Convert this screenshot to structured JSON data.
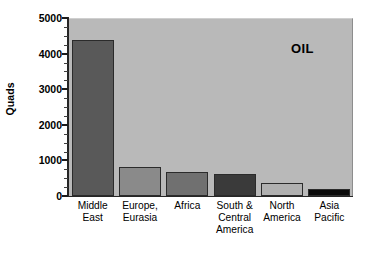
{
  "chart_data": {
    "type": "bar",
    "title": "",
    "annotation": "OIL",
    "xlabel": "",
    "ylabel": "Quads",
    "ylim": [
      0,
      5000
    ],
    "grid": false,
    "legend": "none",
    "y_ticks": [
      0,
      1000,
      2000,
      3000,
      4000,
      5000
    ],
    "y_tick_labels": [
      "0",
      "1000",
      "2000",
      "3000",
      "4000",
      "5000"
    ],
    "y_minor_tick_interval": 250,
    "categories": [
      "Middle East",
      "Europe, Eurasia",
      "Africa",
      "South & Central America",
      "North America",
      "Asia Pacific"
    ],
    "category_label_lines": [
      [
        "Middle",
        "East"
      ],
      [
        "Europe,",
        "Eurasia"
      ],
      [
        "Africa"
      ],
      [
        "South &",
        "Central",
        "America"
      ],
      [
        "North",
        "America"
      ],
      [
        "Asia",
        "Pacific"
      ]
    ],
    "values": [
      4370,
      820,
      670,
      620,
      370,
      185
    ],
    "bar_colors": [
      "#595959",
      "#8a8a8a",
      "#707070",
      "#3a3a3a",
      "#b0b0b0",
      "#0a0a0a"
    ],
    "bar_edge_color": "#2b2b2b",
    "plot_background": "#b9b9b9",
    "figure_background": "#ffffff",
    "axis_color": "#262626",
    "text_color": "#000000"
  }
}
